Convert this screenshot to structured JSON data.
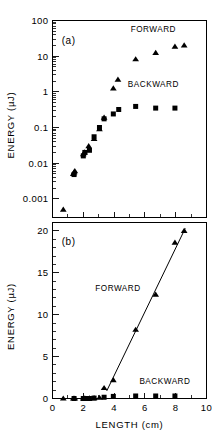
{
  "figure": {
    "background_color": "#ffffff",
    "ink_color": "#000000",
    "panel_a_tag": "(a)",
    "panel_b_tag": "(b)"
  },
  "chart_data": [
    {
      "type": "scatter",
      "panel": "(a)",
      "title": "",
      "xlabel": "",
      "ylabel": "ENERGY  (µJ)",
      "yscale": "log",
      "xscale": "linear",
      "xlim": [
        0,
        10
      ],
      "ylim": [
        0.0003,
        100
      ],
      "grid": false,
      "xticks": [
        0,
        2,
        4,
        6,
        8,
        10
      ],
      "xticklabels": [
        "",
        "",
        "",
        "",
        "",
        ""
      ],
      "yticks": [
        0.001,
        0.01,
        0.1,
        1,
        10,
        100
      ],
      "yticklabels": [
        "0.001",
        "0.01",
        "0.1",
        "1",
        "10",
        "100"
      ],
      "legend_position": "inside-upper-right",
      "series": [
        {
          "name": "FORWARD",
          "marker": "triangle",
          "label_x": 6.55,
          "label_y": 48.0,
          "x": [
            0.7,
            1.35,
            1.4,
            1.45,
            2.0,
            2.08,
            2.35,
            2.7,
            3.05,
            3.35,
            3.95,
            4.25,
            5.4,
            6.7,
            7.95,
            8.55
          ],
          "y": [
            0.0005,
            0.005,
            0.0055,
            0.006,
            0.018,
            0.02,
            0.03,
            0.048,
            0.09,
            0.19,
            1.25,
            2.2,
            8.2,
            12.4,
            18.6,
            20.0
          ]
        },
        {
          "name": "BACKWARD",
          "marker": "square",
          "label_x": 6.55,
          "label_y": 1.35,
          "x": [
            1.4,
            2.0,
            2.1,
            2.4,
            2.7,
            3.05,
            3.35,
            3.95,
            4.3,
            5.4,
            6.7,
            7.95
          ],
          "y": [
            0.0048,
            0.016,
            0.02,
            0.023,
            0.055,
            0.1,
            0.175,
            0.24,
            0.32,
            0.39,
            0.35,
            0.35
          ]
        }
      ]
    },
    {
      "type": "scatter",
      "panel": "(b)",
      "title": "",
      "xlabel": "LENGTH  (cm)",
      "ylabel": "ENERGY  (µJ)",
      "yscale": "linear",
      "xscale": "linear",
      "xlim": [
        0,
        10
      ],
      "ylim": [
        0,
        21
      ],
      "grid": false,
      "xticks": [
        0,
        2,
        4,
        6,
        8,
        10
      ],
      "xticklabels": [
        "0",
        "2",
        "4",
        "6",
        "8",
        "10"
      ],
      "yticks": [
        0,
        5,
        10,
        15,
        20
      ],
      "yticklabels": [
        "0",
        "5",
        "10",
        "15",
        "20"
      ],
      "legend_position": "inside",
      "fit_line": {
        "name": "forward-fit",
        "x0": 3.52,
        "y0": 0.9,
        "x1": 8.62,
        "y1": 20.3
      },
      "series": [
        {
          "name": "FORWARD",
          "marker": "triangle",
          "label_x": 4.25,
          "label_y": 12.8,
          "x": [
            0.7,
            1.35,
            1.45,
            2.0,
            2.1,
            2.4,
            2.7,
            3.05,
            3.35,
            3.95,
            5.4,
            6.7,
            7.95,
            8.55
          ],
          "y": [
            0.0,
            0.0,
            0.0,
            0.0,
            0.02,
            0.03,
            0.05,
            0.09,
            1.25,
            2.2,
            8.2,
            12.4,
            18.6,
            20.0
          ]
        },
        {
          "name": "BACKWARD",
          "marker": "square",
          "label_x": 7.3,
          "label_y": 1.75,
          "x": [
            1.4,
            2.0,
            2.1,
            2.4,
            2.7,
            3.35,
            3.95,
            5.4,
            6.7,
            7.95
          ],
          "y": [
            0.0,
            0.0,
            0.0,
            0.0,
            0.05,
            0.15,
            0.25,
            0.3,
            0.3,
            0.3
          ]
        }
      ]
    }
  ]
}
